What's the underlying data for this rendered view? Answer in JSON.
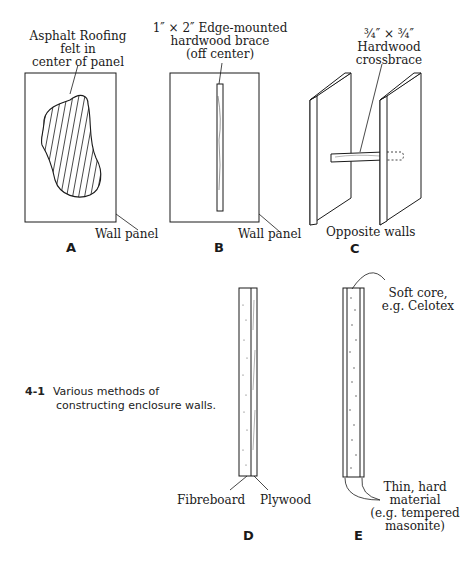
{
  "panels": {
    "A": {
      "letter": "A",
      "callout_lines": [
        "Asphalt Roofing",
        "felt in",
        "center of panel"
      ],
      "panel_label": "Wall panel"
    },
    "B": {
      "letter": "B",
      "callout_lines": [
        "1″ × 2″ Edge-mounted",
        "hardwood brace",
        "(off center)"
      ],
      "panel_label": "Wall panel"
    },
    "C": {
      "letter": "C",
      "callout_lines": [
        "¾″ × ¾″",
        "Hardwood",
        "crossbrace"
      ],
      "panel_label": "Opposite walls"
    },
    "D": {
      "letter": "D",
      "left_label": "Fibreboard",
      "right_label": "Plywood"
    },
    "E": {
      "letter": "E",
      "top_callout_lines": [
        "Soft core,",
        "e.g. Celotex"
      ],
      "bottom_callout_lines": [
        "Thin, hard",
        "material",
        "(e.g. tempered",
        "masonite)"
      ]
    }
  },
  "caption": {
    "number": "4-1",
    "lines": [
      "Various methods of",
      "constructing enclosure walls."
    ]
  },
  "colors": {
    "ink": "#1a1a1a",
    "background": "#ffffff"
  }
}
